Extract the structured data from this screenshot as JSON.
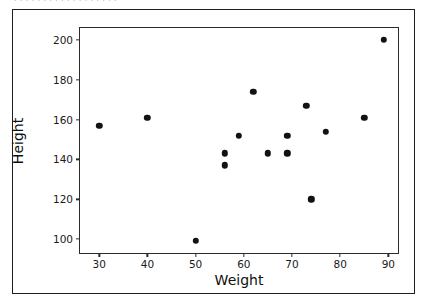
{
  "top_clipped_text": "  .   .   . . .  .  .  .   .   .  .  .   .  .   . .  .  .  ",
  "chart_data": {
    "type": "scatter",
    "title": "",
    "xlabel": "Weight",
    "ylabel": "Height",
    "xlim": [
      26,
      92
    ],
    "ylim": [
      93,
      206
    ],
    "xticks": [
      30,
      40,
      50,
      60,
      70,
      80,
      90
    ],
    "xtick_labels": [
      "30",
      "40",
      "50",
      "60",
      "70",
      "80",
      "90"
    ],
    "yticks": [
      100,
      120,
      140,
      160,
      180,
      200
    ],
    "ytick_labels": [
      "100",
      "120",
      "140",
      "160",
      "180",
      "200"
    ],
    "grid": false,
    "legend": null,
    "marker": {
      "shape": "circle",
      "color": "#121212",
      "size": 6.4
    },
    "points": [
      {
        "x": 30,
        "y": 157
      },
      {
        "x": 40,
        "y": 161
      },
      {
        "x": 50,
        "y": 99
      },
      {
        "x": 56,
        "y": 137
      },
      {
        "x": 56,
        "y": 143
      },
      {
        "x": 59,
        "y": 152
      },
      {
        "x": 62,
        "y": 174
      },
      {
        "x": 65,
        "y": 143
      },
      {
        "x": 69,
        "y": 143
      },
      {
        "x": 69,
        "y": 152
      },
      {
        "x": 73,
        "y": 167
      },
      {
        "x": 74,
        "y": 120
      },
      {
        "x": 77,
        "y": 154
      },
      {
        "x": 85,
        "y": 161
      },
      {
        "x": 89,
        "y": 200
      }
    ]
  }
}
